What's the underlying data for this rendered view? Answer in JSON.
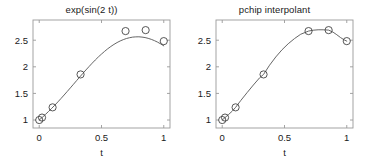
{
  "figure": {
    "background_color": "#ffffff",
    "axis_color": "#9a9a9a",
    "line_color": "#555555",
    "marker_color": "#444444",
    "text_color": "#1a1a1a"
  },
  "chart_data": [
    {
      "type": "line",
      "title": "exp(sin(2 t))",
      "xlabel": "t",
      "ylabel": "",
      "xlim": [
        -0.05,
        1.05
      ],
      "ylim": [
        0.85,
        2.88
      ],
      "xticks": [
        0,
        0.5,
        1
      ],
      "xticklabels": [
        "0",
        "0.5",
        "1"
      ],
      "yticks": [
        1,
        1.5,
        2,
        2.5
      ],
      "yticklabels": [
        "1",
        "1.5",
        "2",
        "2.5"
      ],
      "grid": false,
      "legend": "none",
      "series": [
        {
          "name": "exp(sin(2 t)) curve",
          "style": "solid-line",
          "x": [
            0,
            0.025,
            0.05,
            0.075,
            0.1,
            0.125,
            0.15,
            0.175,
            0.2,
            0.225,
            0.25,
            0.275,
            0.3,
            0.325,
            0.35,
            0.375,
            0.4,
            0.425,
            0.45,
            0.475,
            0.5,
            0.525,
            0.55,
            0.575,
            0.6,
            0.625,
            0.65,
            0.675,
            0.7,
            0.725,
            0.75,
            0.775,
            0.8,
            0.825,
            0.85,
            0.875,
            0.9,
            0.925,
            0.95,
            0.975,
            1
          ],
          "y": [
            1.0,
            1.051,
            1.105,
            1.161,
            1.219,
            1.279,
            1.341,
            1.405,
            1.47,
            1.537,
            1.604,
            1.672,
            1.74,
            1.808,
            1.875,
            1.941,
            2.005,
            2.068,
            2.128,
            2.186,
            2.24,
            2.291,
            2.339,
            2.382,
            2.421,
            2.456,
            2.486,
            2.511,
            2.532,
            2.547,
            2.558,
            2.563,
            2.564,
            2.559,
            2.55,
            2.535,
            2.516,
            2.492,
            2.464,
            2.431,
            2.394
          ]
        },
        {
          "name": "sample points",
          "style": "circle-markers",
          "x": [
            0,
            0.0225,
            0.1074,
            0.3319,
            0.6931,
            0.8545,
            1.0
          ],
          "y": [
            1.0,
            1.046,
            1.238,
            1.857,
            2.672,
            2.69,
            2.483
          ]
        }
      ]
    },
    {
      "type": "line",
      "title": "pchip interpolant",
      "xlabel": "t",
      "ylabel": "",
      "xlim": [
        -0.05,
        1.05
      ],
      "ylim": [
        0.85,
        2.88
      ],
      "xticks": [
        0,
        0.5,
        1
      ],
      "xticklabels": [
        "0",
        "0.5",
        "1"
      ],
      "yticks": [
        1,
        1.5,
        2,
        2.5
      ],
      "yticklabels": [
        "1",
        "1.5",
        "2",
        "2.5"
      ],
      "grid": false,
      "legend": "none",
      "series": [
        {
          "name": "pchip interpolant curve",
          "style": "solid-line",
          "x": [
            0,
            0.0225,
            0.05,
            0.08,
            0.1074,
            0.15,
            0.2,
            0.25,
            0.3,
            0.3319,
            0.38,
            0.43,
            0.48,
            0.53,
            0.58,
            0.63,
            0.6931,
            0.73,
            0.77,
            0.81,
            0.8545,
            0.89,
            0.92,
            0.95,
            0.98,
            1.0
          ],
          "y": [
            1.0,
            1.046,
            1.102,
            1.166,
            1.238,
            1.37,
            1.516,
            1.658,
            1.793,
            1.857,
            2.03,
            2.185,
            2.32,
            2.434,
            2.53,
            2.612,
            2.672,
            2.688,
            2.696,
            2.696,
            2.69,
            2.651,
            2.603,
            2.55,
            2.505,
            2.483
          ]
        },
        {
          "name": "sample points",
          "style": "circle-markers",
          "x": [
            0,
            0.0225,
            0.1074,
            0.3319,
            0.6931,
            0.8545,
            1.0
          ],
          "y": [
            1.0,
            1.046,
            1.238,
            1.857,
            2.672,
            2.69,
            2.483
          ]
        }
      ]
    }
  ]
}
